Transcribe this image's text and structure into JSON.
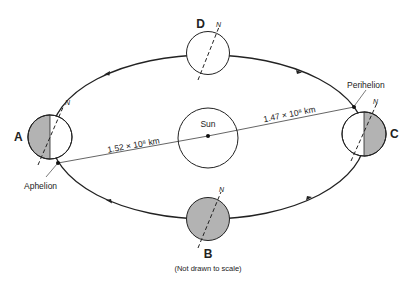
{
  "diagram": {
    "sun": {
      "label": "Sun"
    },
    "positions": [
      {
        "id": "A",
        "label": "A",
        "shading": "left-half"
      },
      {
        "id": "B",
        "label": "B",
        "shading": "full"
      },
      {
        "id": "C",
        "label": "C",
        "shading": "right-half"
      },
      {
        "id": "D",
        "label": "D",
        "shading": "none"
      }
    ],
    "axis_label": "N",
    "aphelion": {
      "label": "Aphelion",
      "distance_label": "1.52 × 10⁸ km"
    },
    "perihelion": {
      "label": "Perihelion",
      "distance_label": "1.47 × 10⁸ km"
    },
    "note": "(Not drawn to scale)",
    "orbit_direction": "counterclockwise",
    "colors": {
      "line": "#222222",
      "shade": "#b3b3b3",
      "background": "#ffffff"
    }
  }
}
